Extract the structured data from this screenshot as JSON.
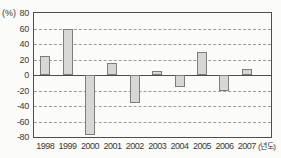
{
  "chart_data": {
    "type": "bar",
    "title": "",
    "categories": [
      "1998",
      "1999",
      "2000",
      "2001",
      "2002",
      "2003",
      "2004",
      "2005",
      "2006",
      "2007"
    ],
    "values": [
      25,
      59,
      -77,
      15,
      -36,
      5,
      -15,
      30,
      -20,
      8
    ],
    "xlabel": "(년도)",
    "ylabel": "(%)",
    "ylim": [
      -80,
      80
    ],
    "yticks": [
      80,
      60,
      40,
      20,
      0,
      -20,
      -40,
      -60,
      -80
    ],
    "ytick_interval": 20,
    "grid": "horizontal-dashed",
    "legend": "none",
    "colors": {
      "bar_fill": "#d7d7d5",
      "bar_border": "#7d7d7b",
      "gridline": "#9b9b99",
      "axis": "#4d4d4b",
      "text": "#3a3a38",
      "background": "#fbfbf9"
    }
  }
}
